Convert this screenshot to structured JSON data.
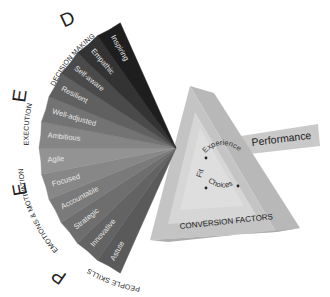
{
  "diagram": {
    "fan": {
      "apex": [
        176,
        148
      ],
      "slices": [
        {
          "label": "Astute",
          "color": "#5a5a5a"
        },
        {
          "label": "Innovative",
          "color": "#636363"
        },
        {
          "label": "Strategic",
          "color": "#6e6e6e"
        },
        {
          "label": "Accountable",
          "color": "#7a7a7a"
        },
        {
          "label": "Focused",
          "color": "#878787"
        },
        {
          "label": "Agile",
          "color": "#939393"
        },
        {
          "label": "Ambitious",
          "color": "#858585"
        },
        {
          "label": "Well-adjusted",
          "color": "#737373"
        },
        {
          "label": "Resilient",
          "color": "#606060"
        },
        {
          "label": "Self-aware",
          "color": "#4a4a4a"
        },
        {
          "label": "Empathic",
          "color": "#333333"
        },
        {
          "label": "Inspiring",
          "color": "#1e1e1e"
        }
      ]
    },
    "categories": [
      {
        "letter": "D",
        "label": "DECISION MAKING"
      },
      {
        "letter": "E",
        "label": "EXECUTION"
      },
      {
        "letter": "E",
        "label": "EMOTIONS & MOTIVATION"
      },
      {
        "letter": "P",
        "label": "PEOPLE SKILLS"
      }
    ],
    "triangle": {
      "inner_labels": [
        "Fit",
        "Experience",
        "Choices"
      ],
      "caption": "CONVERSION FACTORS"
    },
    "output": {
      "label": "Performance"
    }
  }
}
